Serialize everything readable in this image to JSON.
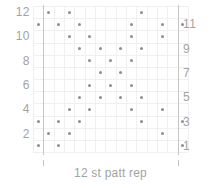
{
  "chart_data": {
    "type": "scatter",
    "title": "",
    "xlabel": "12 st patt rep",
    "ylabel": "",
    "grid": true,
    "columns": 15,
    "rows": 12,
    "xlim": [
      0,
      15
    ],
    "ylim": [
      1,
      12
    ],
    "left_axis_ticks": [
      "12",
      "10",
      "8",
      "6",
      "4",
      "2"
    ],
    "right_axis_ticks": [
      "11",
      "9",
      "7",
      "5",
      "3",
      "1"
    ],
    "left_axis_rows": [
      12,
      10,
      8,
      6,
      4,
      2
    ],
    "right_axis_rows": [
      11,
      9,
      7,
      5,
      3,
      1
    ],
    "repeat_start_column": 2,
    "repeat_end_column": 14,
    "repeat_label": "12 st patt rep",
    "symbol": "dot",
    "symbol_color": "#8e8e93",
    "grid_color": "#f0f0f0",
    "rule_color": "#c2c2c2",
    "points": [
      {
        "row": 12,
        "col": 2
      },
      {
        "row": 12,
        "col": 4
      },
      {
        "row": 12,
        "col": 11
      },
      {
        "row": 11,
        "col": 1
      },
      {
        "row": 11,
        "col": 3
      },
      {
        "row": 11,
        "col": 5
      },
      {
        "row": 11,
        "col": 10
      },
      {
        "row": 11,
        "col": 13
      },
      {
        "row": 11,
        "col": 15
      },
      {
        "row": 10,
        "col": 4
      },
      {
        "row": 10,
        "col": 6
      },
      {
        "row": 10,
        "col": 10
      },
      {
        "row": 10,
        "col": 13
      },
      {
        "row": 9,
        "col": 5
      },
      {
        "row": 9,
        "col": 7
      },
      {
        "row": 9,
        "col": 9
      },
      {
        "row": 9,
        "col": 11
      },
      {
        "row": 8,
        "col": 6
      },
      {
        "row": 8,
        "col": 8
      },
      {
        "row": 8,
        "col": 10
      },
      {
        "row": 7,
        "col": 7
      },
      {
        "row": 7,
        "col": 9
      },
      {
        "row": 6,
        "col": 6
      },
      {
        "row": 6,
        "col": 8
      },
      {
        "row": 6,
        "col": 10
      },
      {
        "row": 5,
        "col": 5
      },
      {
        "row": 5,
        "col": 7
      },
      {
        "row": 5,
        "col": 9
      },
      {
        "row": 5,
        "col": 11
      },
      {
        "row": 4,
        "col": 4
      },
      {
        "row": 4,
        "col": 6
      },
      {
        "row": 4,
        "col": 10
      },
      {
        "row": 4,
        "col": 13
      },
      {
        "row": 3,
        "col": 1
      },
      {
        "row": 3,
        "col": 3
      },
      {
        "row": 3,
        "col": 5
      },
      {
        "row": 3,
        "col": 11
      },
      {
        "row": 3,
        "col": 15
      },
      {
        "row": 2,
        "col": 2
      },
      {
        "row": 2,
        "col": 4
      },
      {
        "row": 2,
        "col": 13
      },
      {
        "row": 1,
        "col": 1
      },
      {
        "row": 1,
        "col": 3
      },
      {
        "row": 1,
        "col": 15
      }
    ]
  }
}
